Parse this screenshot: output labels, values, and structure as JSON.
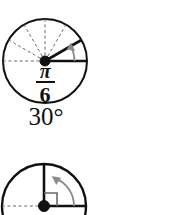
{
  "figure": {
    "background_color": "#ffffff",
    "stroke_color": "#111111",
    "dash_color": "#6b6b6b",
    "arrow_color": "#8a8a8a",
    "width": 183,
    "height": 215,
    "diagrams": [
      {
        "id": "unit-circle-pi-over-6",
        "title": "Unit circle showing angle pi over 6",
        "center_x": 45,
        "center_y": 61,
        "radius": 42,
        "initial_side_degrees": 0,
        "terminal_side_degrees": 30,
        "dashed_ray_degrees": [
          0,
          30,
          60,
          90,
          120,
          150,
          180
        ],
        "rotation_direction": "counterclockwise",
        "radian_numerator": "π",
        "radian_denominator": "6",
        "degree_label": "30°",
        "has_right_angle_marker": false
      },
      {
        "id": "unit-circle-right-angle",
        "title": "Unit circle showing a right angle",
        "center_x": 44,
        "center_y": 206,
        "radius": 42,
        "initial_side_degrees": 0,
        "terminal_side_degrees": 90,
        "dashed_ray_degrees": [
          180
        ],
        "rotation_direction": "counterclockwise",
        "radian_numerator": "",
        "radian_denominator": "",
        "degree_label": "",
        "has_right_angle_marker": true
      }
    ]
  }
}
